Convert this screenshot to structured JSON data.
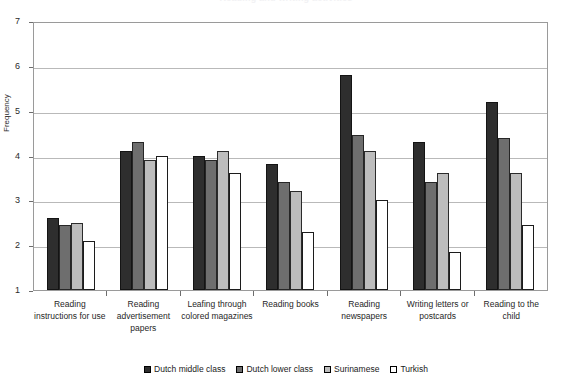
{
  "chart_data": {
    "type": "bar",
    "title": "Reading and writing activities",
    "xlabel": "",
    "ylabel": "Frequency",
    "ylim": [
      1,
      7
    ],
    "yticks": [
      7,
      6,
      5,
      4,
      3,
      2,
      1
    ],
    "grid": true,
    "legend_position": "bottom",
    "categories": [
      "Reading instructions for use",
      "Reading advertisement papers",
      "Leafing through colored magazines",
      "Reading books",
      "Reading newspapers",
      "Writing letters or postcards",
      "Reading to the child"
    ],
    "series": [
      {
        "name": "Dutch middle class",
        "color": "#2e2e2e",
        "values": [
          2.6,
          4.1,
          4.0,
          3.8,
          5.8,
          4.3,
          5.2
        ]
      },
      {
        "name": "Dutch lower class",
        "color": "#6e6e6e",
        "values": [
          2.45,
          4.3,
          3.9,
          3.4,
          4.45,
          3.4,
          4.4
        ]
      },
      {
        "name": "Surinamese",
        "color": "#bdbdbd",
        "values": [
          2.5,
          3.9,
          4.1,
          3.2,
          4.1,
          3.6,
          3.6
        ]
      },
      {
        "name": "Turkish",
        "color": "#ffffff",
        "values": [
          2.1,
          4.0,
          3.6,
          2.3,
          3.0,
          1.85,
          2.45
        ]
      }
    ]
  }
}
